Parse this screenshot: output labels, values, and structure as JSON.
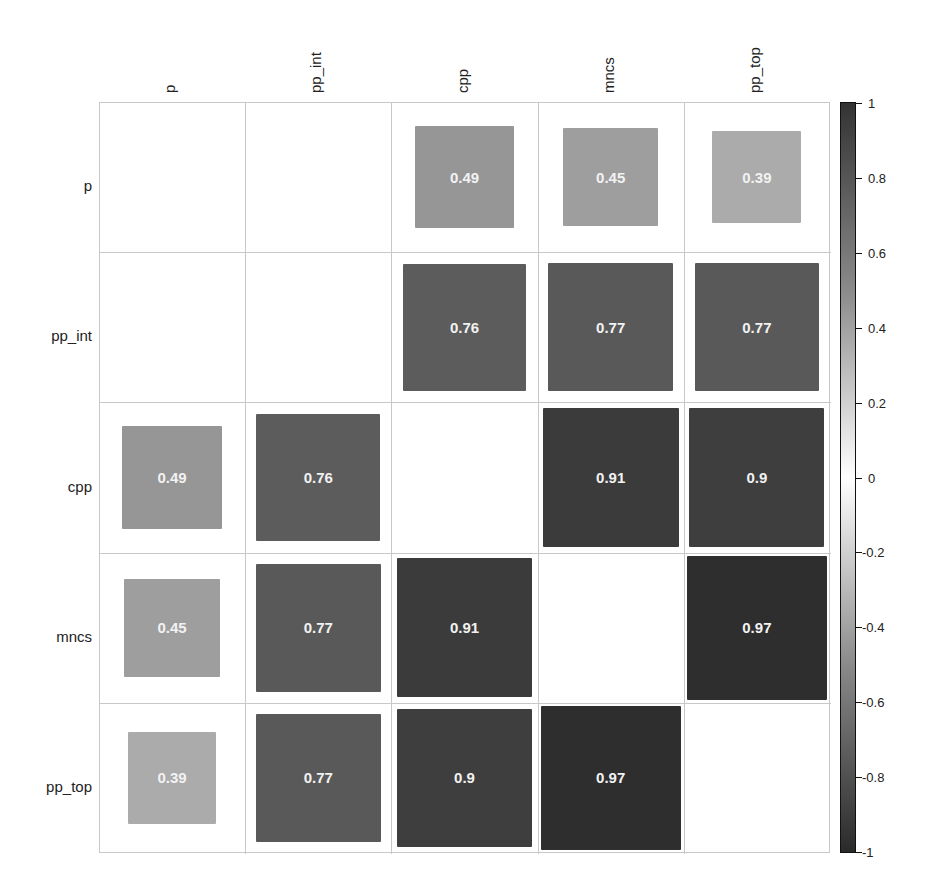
{
  "chart_data": {
    "type": "heatmap",
    "subtype": "correlation-matrix",
    "title": "",
    "variables": [
      "p",
      "pp_int",
      "cpp",
      "mncs",
      "pp_top"
    ],
    "row_labels": [
      "p",
      "pp_int",
      "cpp",
      "mncs",
      "pp_top"
    ],
    "col_labels": [
      "p",
      "pp_int",
      "cpp",
      "mncs",
      "pp_top"
    ],
    "matrix": [
      [
        null,
        null,
        0.49,
        0.45,
        0.39
      ],
      [
        null,
        null,
        0.76,
        0.77,
        0.77
      ],
      [
        0.49,
        0.76,
        null,
        0.91,
        0.9
      ],
      [
        0.45,
        0.77,
        0.91,
        null,
        0.97
      ],
      [
        0.39,
        0.77,
        0.9,
        0.97,
        null
      ]
    ],
    "cell_labels": [
      [
        "",
        "",
        "0.49",
        "0.45",
        "0.39"
      ],
      [
        "",
        "",
        "0.76",
        "0.77",
        "0.77"
      ],
      [
        "0.49",
        "0.76",
        "",
        "0.91",
        "0.9"
      ],
      [
        "0.45",
        "0.77",
        "0.91",
        "",
        "0.97"
      ],
      [
        "0.39",
        "0.77",
        "0.9",
        "0.97",
        ""
      ]
    ],
    "colorbar": {
      "range": [
        -1,
        1
      ],
      "ticks": [
        "1",
        "0.8",
        "0.6",
        "0.4",
        "0.2",
        "0",
        "-0.2",
        "-0.4",
        "-0.6",
        "-0.8",
        "-1"
      ],
      "colors": {
        "high": "#333333",
        "mid": "#ffffff",
        "low": "#2a2a2a"
      }
    },
    "square_size_encodes": "abs(correlation)",
    "grid": true,
    "legend_position": "right"
  }
}
